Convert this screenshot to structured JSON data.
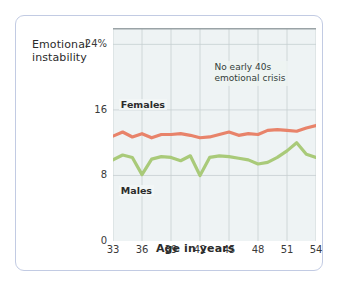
{
  "chart_data": {
    "type": "line",
    "title": "",
    "xlabel": "Age in years",
    "ylabel": "Emotional\ninstability",
    "xlim": [
      33,
      54
    ],
    "ylim": [
      0,
      26
    ],
    "xticks": [
      33,
      36,
      39,
      42,
      45,
      48,
      51,
      54
    ],
    "yticks": [
      0,
      8,
      16,
      24
    ],
    "ytick_labels": [
      "0",
      "8",
      "16",
      "24%"
    ],
    "grid": true,
    "legend": "inline-labels",
    "annotations": [
      {
        "text": "No early 40s\nemotional crisis",
        "x": 46.5,
        "y": 21
      }
    ],
    "x": [
      33,
      34,
      35,
      36,
      37,
      38,
      39,
      40,
      41,
      42,
      43,
      44,
      45,
      46,
      47,
      48,
      49,
      50,
      51,
      52,
      53,
      54
    ],
    "series": [
      {
        "name": "Females",
        "color": "#e8836a",
        "values": [
          12.8,
          13.3,
          12.7,
          13.1,
          12.6,
          13.0,
          13.0,
          13.1,
          12.9,
          12.6,
          12.7,
          13.0,
          13.3,
          12.9,
          13.1,
          13.0,
          13.5,
          13.6,
          13.5,
          13.4,
          13.8,
          14.1
        ]
      },
      {
        "name": "Males",
        "color": "#a9ca79",
        "values": [
          9.9,
          10.5,
          10.2,
          8.1,
          10.0,
          10.3,
          10.2,
          9.8,
          10.4,
          8.0,
          10.2,
          10.4,
          10.3,
          10.1,
          9.9,
          9.4,
          9.6,
          10.2,
          11.0,
          12.0,
          10.6,
          10.2
        ]
      }
    ]
  },
  "labels": {
    "females": "Females",
    "males": "Males"
  },
  "colors": {
    "females_line": "#e8836a",
    "males_line": "#a9ca79",
    "plot_background": "#eef3f4",
    "grid": "#c6cfd2",
    "frame_border": "#c2cbe3"
  }
}
